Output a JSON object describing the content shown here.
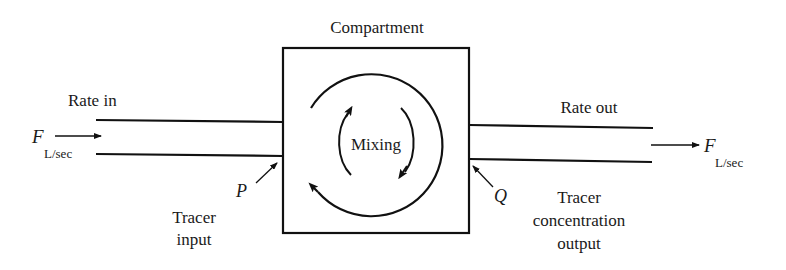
{
  "diagram": {
    "title": "Compartment",
    "center_label": "Mixing",
    "inlet": {
      "label": "Rate in",
      "flow_symbol": "F",
      "flow_unit": "L/sec"
    },
    "outlet": {
      "label": "Rate out",
      "flow_symbol": "F",
      "flow_unit": "L/sec"
    },
    "tracer_in": {
      "symbol": "P",
      "label_line1": "Tracer",
      "label_line2": "input"
    },
    "tracer_out": {
      "symbol": "Q",
      "label_line1": "Tracer",
      "label_line2": "concentration",
      "label_line3": "output"
    },
    "colors": {
      "ink": "#111111",
      "background": "#ffffff"
    }
  }
}
